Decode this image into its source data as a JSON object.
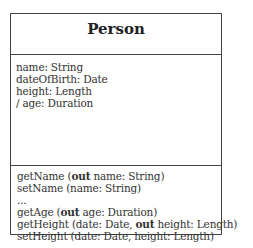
{
  "class": {
    "name": "Person",
    "attributes": [
      "name: String",
      "dateOfBirth: Date",
      "height: Length",
      "/ age: Duration"
    ],
    "operations": [
      {
        "pre": "getName (",
        "kw": "out",
        "post": " name: String)"
      },
      {
        "pre": "setName (name: String)",
        "kw": "",
        "post": ""
      },
      {
        "pre": "...",
        "kw": "",
        "post": ""
      },
      {
        "pre": "getAge (",
        "kw": "out",
        "post": " age: Duration)"
      },
      {
        "pre": "getHeight (date: Date, ",
        "kw": "out",
        "post": " height: Length)"
      },
      {
        "pre": "setHeight (date: Date, height: Length)",
        "kw": "",
        "post": ""
      }
    ]
  }
}
